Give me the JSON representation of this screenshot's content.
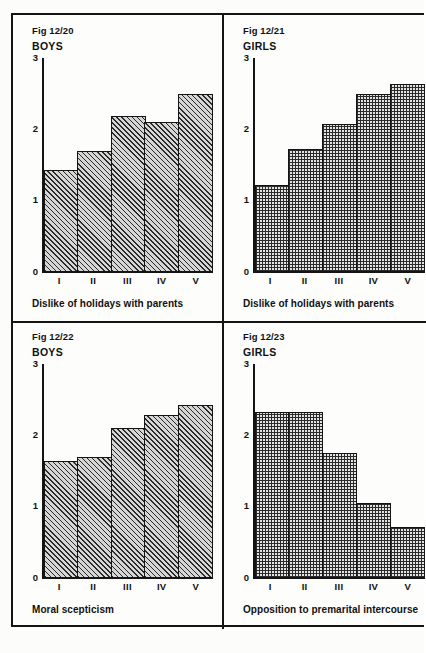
{
  "page": {
    "background_color": "#fcfcfa",
    "ink_color": "#141414"
  },
  "chart_data": [
    {
      "type": "bar",
      "panel": "top-left",
      "fig_id": "Fig 12/20",
      "group": "BOYS",
      "title": "Dislike of holidays with parents",
      "caption": "Dislike of holidays with parents",
      "xlabel": "",
      "ylabel": "",
      "categories": [
        "I",
        "II",
        "III",
        "IV",
        "V"
      ],
      "values": [
        1.43,
        1.69,
        2.18,
        2.1,
        2.5
      ],
      "ylim": [
        0,
        3
      ],
      "yticks": [
        "0",
        "1",
        "2",
        "3"
      ],
      "grid": false,
      "fill": "diagonal-hatch",
      "legend": ""
    },
    {
      "type": "bar",
      "panel": "top-right",
      "fig_id": "Fig 12/21",
      "group": "GIRLS",
      "title": "Dislike of holidays with parents",
      "caption": "Dislike of holidays with parents",
      "xlabel": "",
      "ylabel": "",
      "categories": [
        "I",
        "II",
        "III",
        "IV",
        "V"
      ],
      "values": [
        1.21,
        1.72,
        2.07,
        2.5,
        2.64
      ],
      "ylim": [
        0,
        3
      ],
      "yticks": [
        "0",
        "1",
        "2",
        "3"
      ],
      "grid": false,
      "fill": "dotted-grid",
      "legend": ""
    },
    {
      "type": "bar",
      "panel": "bottom-left",
      "fig_id": "Fig 12/22",
      "group": "BOYS",
      "title": "Moral scepticism",
      "caption": "Moral scepticism",
      "xlabel": "",
      "ylabel": "",
      "categories": [
        "I",
        "II",
        "III",
        "IV",
        "V"
      ],
      "values": [
        1.64,
        1.69,
        2.1,
        2.28,
        2.43
      ],
      "ylim": [
        0,
        3
      ],
      "yticks": [
        "0",
        "1",
        "2",
        "3"
      ],
      "grid": false,
      "fill": "diagonal-hatch",
      "legend": ""
    },
    {
      "type": "bar",
      "panel": "bottom-right",
      "fig_id": "Fig 12/23",
      "group": "GIRLS",
      "title": "Opposition to premarital intercourse",
      "caption": "Opposition to premarital intercourse",
      "xlabel": "",
      "ylabel": "",
      "categories": [
        "I",
        "II",
        "III",
        "IV",
        "V"
      ],
      "values": [
        2.33,
        2.33,
        1.75,
        1.05,
        0.71
      ],
      "ylim": [
        0,
        3
      ],
      "yticks": [
        "0",
        "1",
        "2",
        "3"
      ],
      "grid": false,
      "fill": "dotted-grid",
      "legend": ""
    }
  ]
}
